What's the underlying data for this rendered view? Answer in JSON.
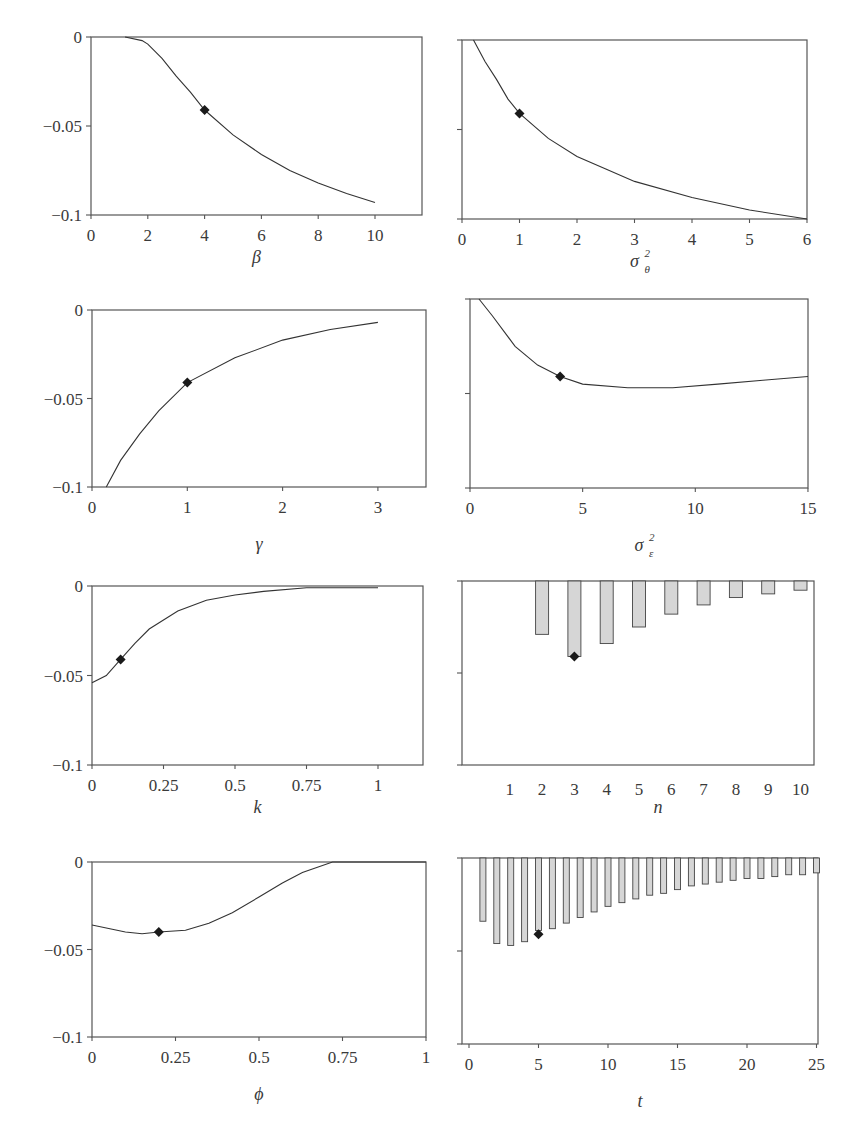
{
  "chart_data": [
    {
      "id": "beta",
      "type": "line",
      "title": "",
      "xlabel": "β",
      "ylabel": "",
      "xlim": [
        0,
        11.65
      ],
      "ylim": [
        -0.1,
        0
      ],
      "xticks": [
        0,
        2,
        4,
        6,
        8,
        10
      ],
      "xticklabels": [
        "0",
        "2",
        "4",
        "6",
        "8",
        "10"
      ],
      "yticks": [
        0,
        -0.05,
        -0.1
      ],
      "yticklabels": [
        "0",
        "−0.05",
        "−0.1"
      ],
      "grid": false,
      "series": [
        {
          "name": "effect",
          "x": [
            1.2,
            1.8,
            2,
            2.5,
            3,
            3.5,
            4,
            5,
            6,
            7,
            8,
            9,
            10
          ],
          "y": [
            0,
            -0.002,
            -0.004,
            -0.012,
            -0.022,
            -0.031,
            -0.041,
            -0.055,
            -0.066,
            -0.075,
            -0.082,
            -0.088,
            -0.093
          ]
        }
      ],
      "baseline_marker": {
        "x": 4,
        "y": -0.041
      },
      "frame": {
        "left": 91,
        "right": 422,
        "top": 37,
        "bottom": 215,
        "x0px": 91,
        "xunit": 28.4
      }
    },
    {
      "id": "sigma_theta",
      "type": "line",
      "xlabel": "σ",
      "xlabel_sup": "2",
      "xlabel_sub": "θ",
      "xlim": [
        0,
        6
      ],
      "ylim": [
        -0.1,
        0
      ],
      "xticks": [
        0,
        1,
        2,
        3,
        4,
        5,
        6
      ],
      "xticklabels": [
        "0",
        "1",
        "2",
        "3",
        "4",
        "5",
        "6"
      ],
      "yticks": [
        0,
        -0.05,
        -0.1
      ],
      "yticklabels": [
        "",
        "",
        ""
      ],
      "grid": false,
      "series": [
        {
          "name": "effect",
          "x": [
            0.2,
            0.4,
            0.6,
            0.8,
            1,
            1.5,
            2,
            2.5,
            3,
            4,
            5,
            6
          ],
          "y": [
            0,
            -0.012,
            -0.022,
            -0.033,
            -0.041,
            -0.055,
            -0.065,
            -0.072,
            -0.079,
            -0.088,
            -0.095,
            -0.1
          ]
        }
      ],
      "baseline_marker": {
        "x": 1,
        "y": -0.041
      },
      "frame": {
        "left": 462,
        "right": 807,
        "top": 40,
        "bottom": 219,
        "x0px": 462,
        "xunit": 57.5
      }
    },
    {
      "id": "gamma",
      "type": "line",
      "xlabel": "γ",
      "xlim": [
        0,
        3.5
      ],
      "ylim": [
        -0.1,
        0
      ],
      "xticks": [
        0,
        1,
        2,
        3
      ],
      "xticklabels": [
        "0",
        "1",
        "2",
        "3"
      ],
      "yticks": [
        0,
        -0.05,
        -0.1
      ],
      "yticklabels": [
        "0",
        "−0.05",
        "−0.1"
      ],
      "grid": false,
      "series": [
        {
          "name": "effect",
          "x": [
            0.15,
            0.3,
            0.5,
            0.7,
            1,
            1.5,
            2,
            2.5,
            3
          ],
          "y": [
            -0.1,
            -0.085,
            -0.07,
            -0.057,
            -0.041,
            -0.027,
            -0.017,
            -0.011,
            -0.007
          ]
        }
      ],
      "baseline_marker": {
        "x": 1,
        "y": -0.041
      },
      "frame": {
        "left": 92,
        "right": 426,
        "top": 310,
        "bottom": 487,
        "x0px": 92,
        "xunit": 95.3
      }
    },
    {
      "id": "sigma_epsilon",
      "type": "line",
      "xlabel": "σ",
      "xlabel_sup": "2",
      "xlabel_sub": "ε",
      "xlim": [
        0,
        15
      ],
      "ylim": [
        -0.1,
        0
      ],
      "xticks": [
        0,
        5,
        10,
        15
      ],
      "xticklabels": [
        "0",
        "5",
        "10",
        "15"
      ],
      "yticks": [
        0,
        -0.05,
        -0.1
      ],
      "yticklabels": [
        "",
        "",
        ""
      ],
      "grid": false,
      "series": [
        {
          "name": "effect",
          "x": [
            0.4,
            1,
            2,
            3,
            4,
            5,
            7,
            9,
            11,
            13,
            15
          ],
          "y": [
            0,
            -0.009,
            -0.025,
            -0.035,
            -0.041,
            -0.045,
            -0.047,
            -0.047,
            -0.045,
            -0.043,
            -0.041
          ]
        }
      ],
      "baseline_marker": {
        "x": 4,
        "y": -0.041
      },
      "frame": {
        "left": 470,
        "right": 808,
        "top": 299,
        "bottom": 488,
        "x0px": 470,
        "xunit": 22.53
      }
    },
    {
      "id": "k",
      "type": "line",
      "xlabel": "k",
      "xlim": [
        0,
        1.16
      ],
      "ylim": [
        -0.1,
        0
      ],
      "xticks": [
        0,
        0.25,
        0.5,
        0.75,
        1
      ],
      "xticklabels": [
        "0",
        "0.25",
        "0.5",
        "0.75",
        "1"
      ],
      "yticks": [
        0,
        -0.05,
        -0.1
      ],
      "yticklabels": [
        "0",
        "−0.05",
        "−0.1"
      ],
      "grid": false,
      "series": [
        {
          "name": "effect",
          "x": [
            0,
            0.05,
            0.1,
            0.15,
            0.2,
            0.3,
            0.4,
            0.5,
            0.6,
            0.75,
            1
          ],
          "y": [
            -0.054,
            -0.05,
            -0.041,
            -0.032,
            -0.024,
            -0.014,
            -0.008,
            -0.005,
            -0.003,
            -0.001,
            -0.001
          ]
        }
      ],
      "baseline_marker": {
        "x": 0.1,
        "y": -0.041
      },
      "frame": {
        "left": 92,
        "right": 423,
        "top": 586,
        "bottom": 765,
        "x0px": 92,
        "xunit": 286
      }
    },
    {
      "id": "n",
      "type": "bar",
      "xlabel": "n",
      "categories": [
        "1",
        "2",
        "3",
        "4",
        "5",
        "6",
        "7",
        "8",
        "9",
        "10"
      ],
      "values": [
        0,
        -0.029,
        -0.041,
        -0.034,
        -0.025,
        -0.018,
        -0.013,
        -0.009,
        -0.007,
        -0.005
      ],
      "ylim": [
        -0.1,
        0
      ],
      "yticks": [
        0,
        -0.05,
        -0.1
      ],
      "yticklabels": [
        "",
        "",
        ""
      ],
      "grid": false,
      "baseline_marker": {
        "category": "3",
        "y": -0.041
      },
      "frame": {
        "left": 462,
        "right": 814,
        "top": 581,
        "bottom": 765,
        "x0px": 477.5,
        "xunit": 32.3,
        "barwidth": 13
      }
    },
    {
      "id": "phi",
      "type": "line",
      "xlabel": "ϕ",
      "xlim": [
        0,
        1
      ],
      "ylim": [
        -0.1,
        0
      ],
      "xticks": [
        0,
        0.25,
        0.5,
        0.75,
        1
      ],
      "xticklabels": [
        "0",
        "0.25",
        "0.5",
        "0.75",
        "1"
      ],
      "yticks": [
        0,
        -0.05,
        -0.1
      ],
      "yticklabels": [
        "0",
        "−0.05",
        "−0.1"
      ],
      "grid": false,
      "series": [
        {
          "name": "effect",
          "x": [
            0,
            0.05,
            0.1,
            0.15,
            0.2,
            0.28,
            0.35,
            0.42,
            0.5,
            0.57,
            0.63,
            0.72,
            1
          ],
          "y": [
            -0.036,
            -0.038,
            -0.04,
            -0.041,
            -0.04,
            -0.039,
            -0.035,
            -0.029,
            -0.02,
            -0.012,
            -0.006,
            0,
            0
          ]
        }
      ],
      "baseline_marker": {
        "x": 0.2,
        "y": -0.04
      },
      "frame": {
        "left": 92,
        "right": 426,
        "top": 862,
        "bottom": 1037,
        "x0px": 92,
        "xunit": 334
      }
    },
    {
      "id": "t",
      "type": "bar",
      "xlabel": "t",
      "categories": [
        "1",
        "2",
        "3",
        "4",
        "5",
        "6",
        "7",
        "8",
        "9",
        "10",
        "11",
        "12",
        "13",
        "14",
        "15",
        "16",
        "17",
        "18",
        "19",
        "20",
        "21",
        "22",
        "23",
        "24",
        "25"
      ],
      "values": [
        -0.034,
        -0.046,
        -0.047,
        -0.045,
        -0.039,
        -0.038,
        -0.035,
        -0.032,
        -0.029,
        -0.026,
        -0.024,
        -0.022,
        -0.02,
        -0.019,
        -0.017,
        -0.015,
        -0.014,
        -0.013,
        -0.012,
        -0.011,
        -0.011,
        -0.01,
        -0.009,
        -0.009,
        -0.008
      ],
      "xticks": [
        0,
        5,
        10,
        15,
        20,
        25
      ],
      "xticklabels": [
        "0",
        "5",
        "10",
        "15",
        "20",
        "25"
      ],
      "ylim": [
        -0.1,
        0
      ],
      "yticks": [
        0,
        -0.05,
        -0.1
      ],
      "yticklabels": [
        "",
        "",
        ""
      ],
      "grid": false,
      "baseline_marker": {
        "category": "5",
        "y": -0.041
      },
      "frame": {
        "left": 462,
        "right": 818,
        "top": 858,
        "bottom": 1044,
        "x0px": 469,
        "xunit": 13.9,
        "barwidth": 6
      }
    }
  ]
}
